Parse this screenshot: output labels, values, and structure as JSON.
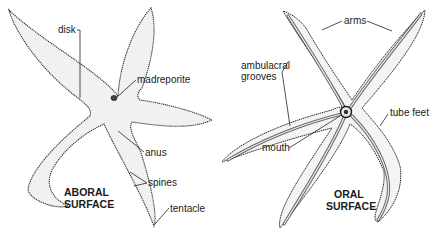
{
  "figure": {
    "aboral": {
      "title_line1": "ABORAL",
      "title_line2": "SURFACE",
      "labels": {
        "disk": "disk",
        "madreporite": "madreporite",
        "anus": "anus",
        "spines": "spines",
        "tentacle": "tentacle"
      }
    },
    "oral": {
      "title_line1": "ORAL",
      "title_line2": "SURFACE",
      "labels": {
        "arms": "arms",
        "ambulacral_line1": "ambulacral",
        "ambulacral_line2": "grooves",
        "tube_feet": "tube feet",
        "mouth": "mouth"
      }
    }
  },
  "colors": {
    "ink": "#1a1a1a",
    "body_fill": "#f1f1f1",
    "groove": "#3a3a3a"
  }
}
